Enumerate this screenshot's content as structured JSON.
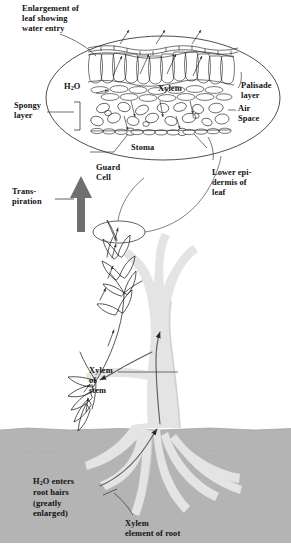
{
  "figure": {
    "title": "Enlargement of\nleaf showing\nwater entry",
    "type": "biology-diagram",
    "background_color": "#ffffff",
    "ink_color": "#121212",
    "soil_color": "#b4b4b4",
    "tree_color": "#e4e4e4",
    "tree_shadow_color": "#d2d2d2",
    "arrow_gray": "#6f6f6f",
    "xylem_line_color": "#555555"
  },
  "leaf_inset": {
    "name": "leaf cross-section enlargement",
    "shape": "ellipse",
    "labels": {
      "water": "H",
      "water_sub": "2",
      "water_tail": "O",
      "xylem": "Xylem",
      "palisade": "Palisade\nlayer",
      "air_space": "Air\nSpace",
      "spongy": "Spongy\nlayer",
      "stoma": "Stoma",
      "guard_cell": "Guard\nCell",
      "lower_epidermis": "Lower epi-\ndermis of\nleaf"
    }
  },
  "plant": {
    "transpiration": "Trans-\npiration",
    "xylem_of_stem": "Xylem\nof\nstem",
    "root_hairs": "H",
    "root_hairs_sub": "2",
    "root_hairs_tail": "O enters\nroot hairs\n(greatly\nenlarged)",
    "xylem_of_root": "Xylem\nelement of root"
  }
}
